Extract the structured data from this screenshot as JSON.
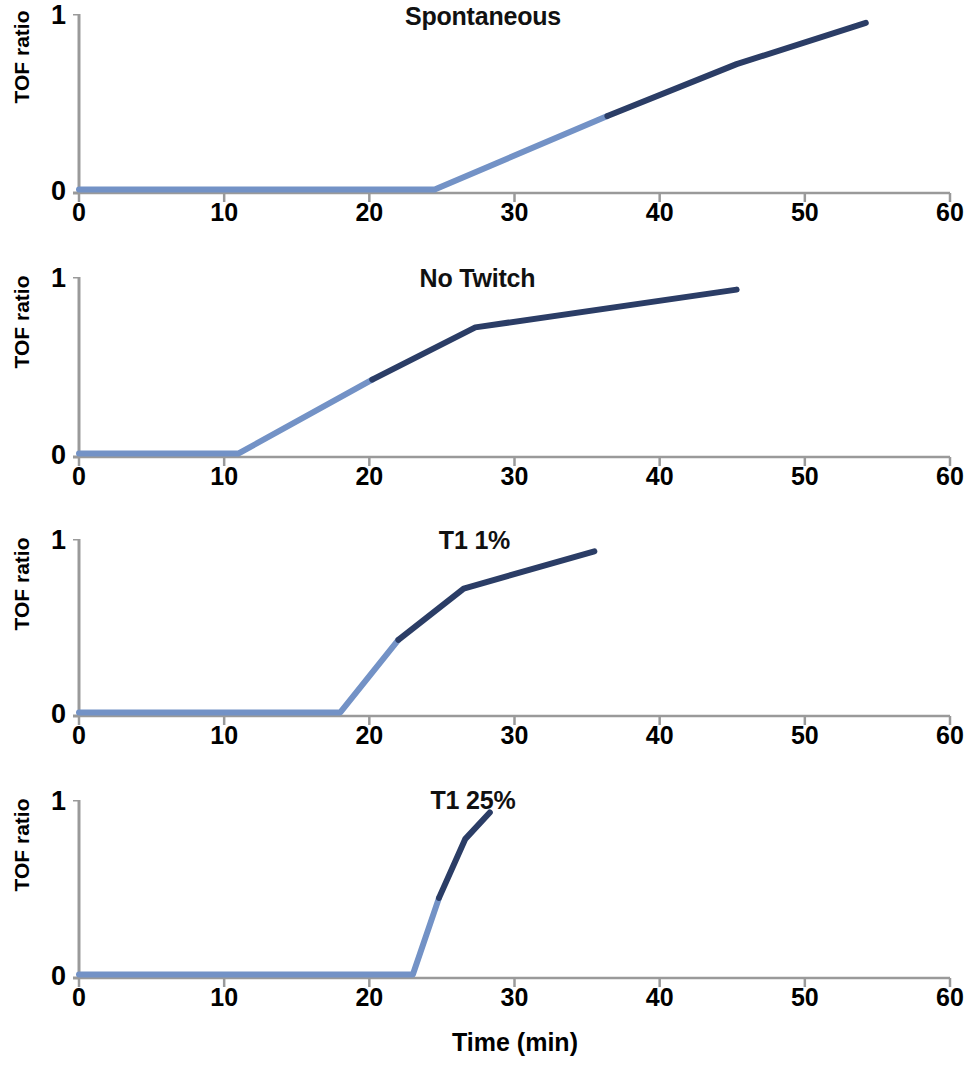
{
  "figure": {
    "width": 960,
    "height": 1065,
    "background": "#ffffff",
    "x_axis_label": "Time (min)",
    "y_axis_label": "TOF ratio",
    "y_tick_top": "1",
    "y_tick_bottom": "0",
    "x_tick_labels": [
      "0",
      "10",
      "20",
      "30",
      "40",
      "50",
      "60"
    ],
    "colors": {
      "line_light": "#7392c6",
      "line_dark": "#2b3d66",
      "axis": "#9a9a9a",
      "text": "#000000"
    }
  },
  "chart_data": [
    {
      "type": "line",
      "title": "Spontaneous",
      "xlabel": "Time (min)",
      "ylabel": "TOF ratio",
      "xlim": [
        0,
        60
      ],
      "ylim": [
        0,
        1
      ],
      "xticks": [
        0,
        10,
        20,
        30,
        40,
        50,
        60
      ],
      "yticks": [
        0,
        1
      ],
      "grid": false,
      "legend": "none",
      "series": [
        {
          "name": "early-phase",
          "color": "#7392c6",
          "x": [
            0,
            24.5,
            36.4
          ],
          "values": [
            0.02,
            0.02,
            0.43
          ]
        },
        {
          "name": "late-phase",
          "color": "#2b3d66",
          "x": [
            36.4,
            45.3,
            54.2
          ],
          "values": [
            0.43,
            0.72,
            0.95
          ]
        }
      ]
    },
    {
      "type": "line",
      "title": "No Twitch",
      "xlabel": "Time (min)",
      "ylabel": "TOF ratio",
      "xlim": [
        0,
        60
      ],
      "ylim": [
        0,
        1
      ],
      "xticks": [
        0,
        10,
        20,
        30,
        40,
        50,
        60
      ],
      "yticks": [
        0,
        1
      ],
      "grid": false,
      "legend": "none",
      "series": [
        {
          "name": "early-phase",
          "color": "#7392c6",
          "x": [
            0,
            11.0,
            20.2
          ],
          "values": [
            0.02,
            0.02,
            0.43
          ]
        },
        {
          "name": "late-phase",
          "color": "#2b3d66",
          "x": [
            20.2,
            27.3,
            45.3
          ],
          "values": [
            0.43,
            0.72,
            0.93
          ]
        }
      ]
    },
    {
      "type": "line",
      "title": "T1 1%",
      "xlabel": "Time (min)",
      "ylabel": "TOF ratio",
      "xlim": [
        0,
        60
      ],
      "ylim": [
        0,
        1
      ],
      "xticks": [
        0,
        10,
        20,
        30,
        40,
        50,
        60
      ],
      "yticks": [
        0,
        1
      ],
      "grid": false,
      "legend": "none",
      "series": [
        {
          "name": "early-phase",
          "color": "#7392c6",
          "x": [
            0,
            18.0,
            22.0
          ],
          "values": [
            0.02,
            0.02,
            0.43
          ]
        },
        {
          "name": "late-phase",
          "color": "#2b3d66",
          "x": [
            22.0,
            26.5,
            35.5
          ],
          "values": [
            0.43,
            0.72,
            0.93
          ]
        }
      ]
    },
    {
      "type": "line",
      "title": "T1 25%",
      "xlabel": "Time (min)",
      "ylabel": "TOF ratio",
      "xlim": [
        0,
        60
      ],
      "ylim": [
        0,
        1
      ],
      "xticks": [
        0,
        10,
        20,
        30,
        40,
        50,
        60
      ],
      "yticks": [
        0,
        1
      ],
      "grid": false,
      "legend": "none",
      "series": [
        {
          "name": "early-phase",
          "color": "#7392c6",
          "x": [
            0,
            23.0,
            24.8
          ],
          "values": [
            0.02,
            0.02,
            0.45
          ]
        },
        {
          "name": "late-phase",
          "color": "#2b3d66",
          "x": [
            24.8,
            26.6,
            28.3
          ],
          "values": [
            0.45,
            0.78,
            0.93
          ]
        }
      ]
    }
  ],
  "panels": [
    {
      "title": "Spontaneous",
      "title_left": 398,
      "title_top": 2,
      "title_width": 170,
      "top": 0,
      "height": 235,
      "plot_top": 14,
      "plot_bottom": 193,
      "x0": 79,
      "x60": 950,
      "ylabel_top": 45,
      "ytick1_top": 0,
      "ytick0_top": 176,
      "xtick_top": 198,
      "show_xticks": true
    },
    {
      "title": "No Twitch",
      "title_left": 405,
      "title_top": 264,
      "title_width": 145,
      "top": 240,
      "height": 255,
      "plot_top": 277,
      "plot_bottom": 457,
      "x0": 79,
      "x60": 950,
      "ylabel_top": 310,
      "ytick1_top": 263,
      "ytick0_top": 440,
      "xtick_top": 462,
      "show_xticks": true
    },
    {
      "title": "T1 1%",
      "title_left": 432,
      "title_top": 526,
      "title_width": 85,
      "top": 500,
      "height": 255,
      "plot_top": 539,
      "plot_bottom": 716,
      "x0": 79,
      "x60": 950,
      "ylabel_top": 572,
      "ytick1_top": 525,
      "ytick0_top": 699,
      "xtick_top": 721,
      "show_xticks": true
    },
    {
      "title": "T1 25%",
      "title_left": 422,
      "title_top": 786,
      "title_width": 102,
      "top": 760,
      "height": 305,
      "plot_top": 800,
      "plot_bottom": 978,
      "x0": 79,
      "x60": 950,
      "ylabel_top": 833,
      "ytick1_top": 786,
      "ytick0_top": 961,
      "xtick_top": 983,
      "show_xticks": true
    }
  ]
}
